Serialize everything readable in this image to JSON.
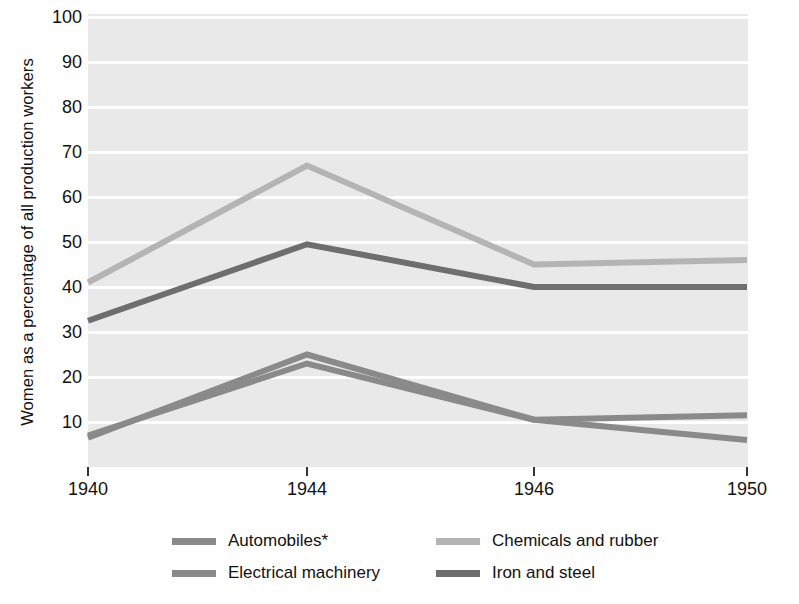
{
  "chart_data": {
    "type": "line",
    "title": "",
    "xlabel": "",
    "ylabel": "Women as a percentage of all production workers",
    "x": [
      1940,
      1944,
      1946,
      1950
    ],
    "xtick_labels": [
      "1940",
      "1944",
      "1946",
      "1950"
    ],
    "ytick_labels": [
      "10",
      "20",
      "30",
      "40",
      "50",
      "60",
      "70",
      "80",
      "90",
      "100"
    ],
    "ylim": [
      0,
      100
    ],
    "ytick_step": 10,
    "grid": "horizontal-white-gridlines",
    "legend_position": "bottom",
    "plot_background": "#e9e9e9",
    "series": [
      {
        "name": "Automobiles*",
        "color": "#8a8a8a",
        "values": [
          6.5,
          25.0,
          10.5,
          6.0
        ]
      },
      {
        "name": "Chemicals and rubber",
        "color": "#b4b4b4",
        "values": [
          41.0,
          67.0,
          45.0,
          46.0
        ]
      },
      {
        "name": "Electrical machinery",
        "color": "#8a8a8a",
        "values": [
          7.0,
          23.0,
          10.5,
          11.5
        ]
      },
      {
        "name": "Iron and steel",
        "color": "#6e6e6e",
        "values": [
          32.5,
          49.5,
          40.0,
          40.0
        ]
      }
    ],
    "annotations": [
      "*"
    ]
  },
  "legend": {
    "items": [
      {
        "label": "Automobiles*",
        "color": "#8a8a8a"
      },
      {
        "label": "Chemicals and rubber",
        "color": "#b4b4b4"
      },
      {
        "label": "Electrical machinery",
        "color": "#8a8a8a"
      },
      {
        "label": "Iron and steel",
        "color": "#6e6e6e"
      }
    ]
  }
}
